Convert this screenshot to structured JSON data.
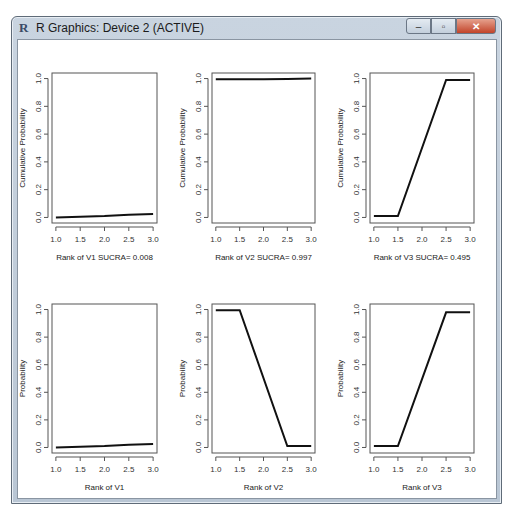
{
  "window": {
    "title": "R Graphics: Device 2 (ACTIVE)",
    "controls": {
      "minimize": "–",
      "maximize": "▫",
      "close": "✕"
    }
  },
  "chart_data": [
    {
      "type": "line",
      "title": "",
      "xlabel": "Rank of V1  SUCRA= 0.008",
      "ylabel": "Cumulative Probability",
      "x": [
        1.0,
        1.5,
        2.0,
        2.5,
        3.0
      ],
      "values": [
        0.0,
        0.005,
        0.01,
        0.02,
        0.025
      ],
      "xlim": [
        1.0,
        3.0
      ],
      "ylim": [
        0.0,
        1.0
      ],
      "xticks": [
        "1.0",
        "1.5",
        "2.0",
        "2.5",
        "3.0"
      ],
      "yticks": [
        "0.0",
        "0.2",
        "0.4",
        "0.6",
        "0.8",
        "1.0"
      ]
    },
    {
      "type": "line",
      "title": "",
      "xlabel": "Rank of V2  SUCRA= 0.997",
      "ylabel": "Cumulative Probability",
      "x": [
        1.0,
        1.5,
        2.0,
        2.5,
        3.0
      ],
      "values": [
        0.995,
        0.995,
        0.995,
        0.997,
        1.0
      ],
      "xlim": [
        1.0,
        3.0
      ],
      "ylim": [
        0.0,
        1.0
      ],
      "xticks": [
        "1.0",
        "1.5",
        "2.0",
        "2.5",
        "3.0"
      ],
      "yticks": [
        "0.0",
        "0.2",
        "0.4",
        "0.6",
        "0.8",
        "1.0"
      ]
    },
    {
      "type": "line",
      "title": "",
      "xlabel": "Rank of V3  SUCRA= 0.495",
      "ylabel": "Cumulative Probability",
      "x": [
        1.0,
        1.5,
        2.5,
        3.0
      ],
      "values": [
        0.01,
        0.01,
        0.99,
        0.99
      ],
      "xlim": [
        1.0,
        3.0
      ],
      "ylim": [
        0.0,
        1.0
      ],
      "xticks": [
        "1.0",
        "1.5",
        "2.0",
        "2.5",
        "3.0"
      ],
      "yticks": [
        "0.0",
        "0.2",
        "0.4",
        "0.6",
        "0.8",
        "1.0"
      ]
    },
    {
      "type": "line",
      "title": "",
      "xlabel": "Rank of V1",
      "ylabel": "Probability",
      "x": [
        1.0,
        1.5,
        2.0,
        2.5,
        3.0
      ],
      "values": [
        0.0,
        0.005,
        0.01,
        0.02,
        0.025
      ],
      "xlim": [
        1.0,
        3.0
      ],
      "ylim": [
        0.0,
        1.0
      ],
      "xticks": [
        "1.0",
        "1.5",
        "2.0",
        "2.5",
        "3.0"
      ],
      "yticks": [
        "0.0",
        "0.2",
        "0.4",
        "0.6",
        "0.8",
        "1.0"
      ]
    },
    {
      "type": "line",
      "title": "",
      "xlabel": "Rank of V2",
      "ylabel": "Probability",
      "x": [
        1.0,
        1.5,
        2.5,
        3.0
      ],
      "values": [
        0.995,
        0.995,
        0.01,
        0.01
      ],
      "xlim": [
        1.0,
        3.0
      ],
      "ylim": [
        0.0,
        1.0
      ],
      "xticks": [
        "1.0",
        "1.5",
        "2.0",
        "2.5",
        "3.0"
      ],
      "yticks": [
        "0.0",
        "0.2",
        "0.4",
        "0.6",
        "0.8",
        "1.0"
      ]
    },
    {
      "type": "line",
      "title": "",
      "xlabel": "Rank of V3",
      "ylabel": "Probability",
      "x": [
        1.0,
        1.5,
        2.5,
        3.0
      ],
      "values": [
        0.01,
        0.01,
        0.98,
        0.98
      ],
      "xlim": [
        1.0,
        3.0
      ],
      "ylim": [
        0.0,
        1.0
      ],
      "xticks": [
        "1.0",
        "1.5",
        "2.0",
        "2.5",
        "3.0"
      ],
      "yticks": [
        "0.0",
        "0.2",
        "0.4",
        "0.6",
        "0.8",
        "1.0"
      ]
    }
  ]
}
